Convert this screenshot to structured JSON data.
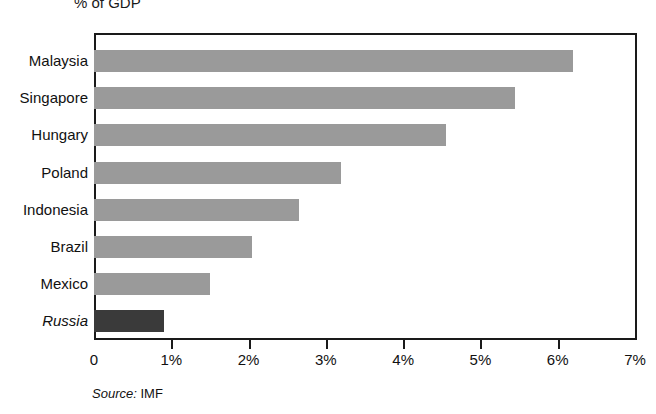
{
  "chart_data": {
    "type": "bar",
    "orientation": "horizontal",
    "title": "% of GDP",
    "xlabel": "",
    "ylabel": "",
    "xlim": [
      0,
      7
    ],
    "grid": false,
    "legend": null,
    "x_tick_labels": [
      "0",
      "1%",
      "2%",
      "3%",
      "4%",
      "5%",
      "6%",
      "7%"
    ],
    "x_tick_values": [
      0,
      1,
      2,
      3,
      4,
      5,
      6,
      7
    ],
    "categories": [
      "Malaysia",
      "Singapore",
      "Hungary",
      "Poland",
      "Indonesia",
      "Brazil",
      "Mexico",
      "Russia"
    ],
    "values": [
      6.2,
      5.45,
      4.55,
      3.2,
      2.65,
      2.05,
      1.5,
      0.9
    ],
    "bars": [
      {
        "label": "Malaysia",
        "value": 6.2,
        "highlight": false,
        "label_italic": false
      },
      {
        "label": "Singapore",
        "value": 5.45,
        "highlight": false,
        "label_italic": false
      },
      {
        "label": "Hungary",
        "value": 4.55,
        "highlight": false,
        "label_italic": false
      },
      {
        "label": "Poland",
        "value": 3.2,
        "highlight": false,
        "label_italic": false
      },
      {
        "label": "Indonesia",
        "value": 2.65,
        "highlight": false,
        "label_italic": false
      },
      {
        "label": "Brazil",
        "value": 2.05,
        "highlight": false,
        "label_italic": false
      },
      {
        "label": "Mexico",
        "value": 1.5,
        "highlight": false,
        "label_italic": false
      },
      {
        "label": "Russia",
        "value": 0.9,
        "highlight": true,
        "label_italic": true
      }
    ],
    "colors": {
      "bar": "#9a9a9a",
      "bar_highlight": "#3a3a3a",
      "axis": "#1a1a1a",
      "text": "#111111",
      "background": "#ffffff"
    },
    "source_prefix": "Source:",
    "source_name": "IMF"
  }
}
